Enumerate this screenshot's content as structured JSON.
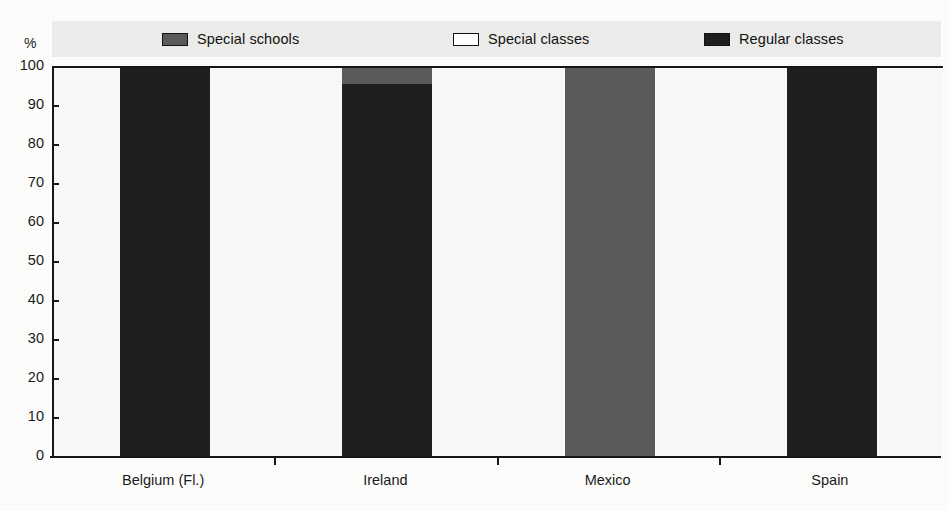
{
  "chart_data": {
    "type": "bar",
    "stacked": true,
    "title": "",
    "subtitle": "",
    "xlabel": "",
    "ylabel": "%",
    "ylim": [
      0,
      100
    ],
    "ytick_labels": [
      "100",
      "90",
      "80",
      "70",
      "60",
      "50",
      "40",
      "30",
      "20",
      "10",
      "0"
    ],
    "ytick_values": [
      100,
      90,
      80,
      70,
      60,
      50,
      40,
      30,
      20,
      10,
      0
    ],
    "grid": false,
    "legend_position": "top",
    "categories": [
      "Belgium (Fl.)",
      "Ireland",
      "Mexico",
      "Spain"
    ],
    "series": [
      {
        "name": "Special schools",
        "color": "#5a5a5a",
        "values": [
          0,
          4,
          100,
          0
        ]
      },
      {
        "name": "Special classes",
        "color": "#ffffff",
        "values": [
          0,
          0,
          0,
          0
        ]
      },
      {
        "name": "Regular classes",
        "color": "#1f1f1f",
        "values": [
          100,
          96,
          0,
          100
        ]
      }
    ]
  },
  "legend": {
    "items": [
      {
        "label": "Special schools",
        "color": "#5a5a5a"
      },
      {
        "label": "Special classes",
        "color": "#ffffff"
      },
      {
        "label": "Regular classes",
        "color": "#1f1f1f"
      }
    ]
  },
  "axis": {
    "unit_label": "%"
  },
  "colors": {
    "special_schools": "#5a5a5a",
    "special_classes": "#ffffff",
    "regular_classes": "#1f1f1f",
    "axis_line": "#161616",
    "legend_band": "#ebebe9",
    "plot_background": "#f7f7f5"
  }
}
